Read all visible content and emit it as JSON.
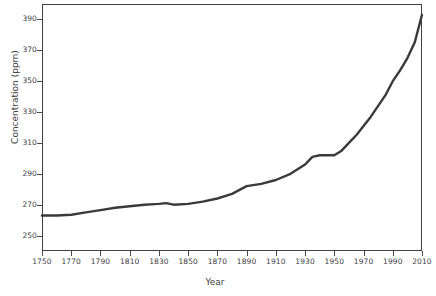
{
  "chart_data": {
    "type": "line",
    "title": "",
    "xlabel": "Year",
    "ylabel": "Concentration (ppm)",
    "xlim": [
      1750,
      2010
    ],
    "ylim": [
      240,
      400
    ],
    "grid": false,
    "legend": "none",
    "line_color": "#3a3a3a",
    "line_width": 2.4,
    "background": "#ffffff",
    "axis_color": "#3f3f3f",
    "text_color": "#3d3d3d",
    "xticks": [
      1750,
      1770,
      1790,
      1810,
      1830,
      1850,
      1870,
      1890,
      1910,
      1930,
      1950,
      1970,
      1990,
      2010
    ],
    "xtick_labels": [
      "1750",
      "1770",
      "1790",
      "1810",
      "1830",
      "1850",
      "1870",
      "1890",
      "1910",
      "1930",
      "1950",
      "1970",
      "1990",
      "2010"
    ],
    "yticks": [
      250,
      270,
      290,
      310,
      330,
      350,
      370,
      390
    ],
    "ytick_labels": [
      "250",
      "270",
      "290",
      "310",
      "330",
      "350",
      "370",
      "390"
    ],
    "series": [
      {
        "name": "CO2 concentration",
        "x": [
          1750,
          1760,
          1770,
          1780,
          1790,
          1800,
          1810,
          1820,
          1830,
          1835,
          1840,
          1850,
          1860,
          1870,
          1880,
          1890,
          1900,
          1910,
          1920,
          1930,
          1935,
          1940,
          1945,
          1950,
          1955,
          1960,
          1965,
          1970,
          1975,
          1980,
          1985,
          1990,
          1995,
          2000,
          2005,
          2010
        ],
        "y": [
          263,
          263,
          263.5,
          265,
          266.5,
          268,
          269,
          270,
          270.5,
          271,
          270,
          270.5,
          272,
          274,
          277,
          282,
          283.5,
          286,
          290,
          296,
          301,
          302,
          302,
          302,
          305,
          310,
          315,
          321,
          327,
          334,
          341,
          350,
          357,
          365,
          375,
          393
        ]
      }
    ]
  }
}
